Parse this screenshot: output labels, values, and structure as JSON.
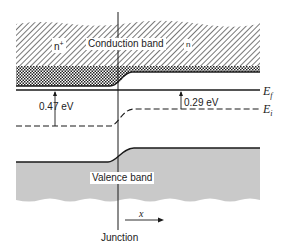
{
  "diagram": {
    "type": "energy-band-diagram",
    "regions": {
      "left": "n+",
      "right": "n"
    },
    "labels": {
      "conduction_band": "Conduction band",
      "valence_band": "Valence band",
      "n_plus": "n+",
      "n": "n",
      "fermi_level": "Ef",
      "intrinsic_level": "Ei",
      "junction": "Junction",
      "x_axis": "x"
    },
    "energies": {
      "left_gap_label": "0.47 eV",
      "right_gap_label": "0.29 eV"
    },
    "colors": {
      "line": "#1a1a1a",
      "valence_fill": "#c9c9c9",
      "hatch": "#555555"
    }
  }
}
